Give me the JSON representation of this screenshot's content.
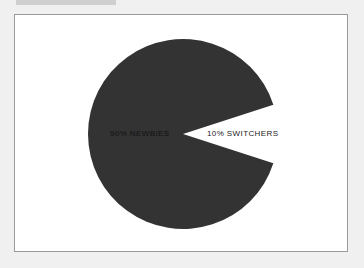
{
  "chart_data": {
    "type": "pie",
    "title": "",
    "slices": [
      {
        "label": "90% NEWBIES",
        "value": 90,
        "color": "#333333",
        "label_color": "#111111"
      },
      {
        "label": "10% SWITCHERS",
        "value": 10,
        "color": "#ffffff",
        "label_color": "#222222"
      }
    ],
    "legend": "none",
    "start_angle_deg": -18
  },
  "labels": {
    "newbies": "90% NEWBIES",
    "switchers": "10% SWITCHERS"
  }
}
